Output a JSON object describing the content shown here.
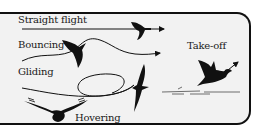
{
  "diagram": {
    "labels": {
      "straight": "Straight flight",
      "bouncing": "Bouncing",
      "gliding": "Gliding",
      "hovering": "Hovering",
      "takeoff": "Take-off"
    },
    "colors": {
      "background": "#f2f2f2",
      "ink": "#111111",
      "frame": "#111111"
    },
    "icons": [
      "straight-flight-bird-icon",
      "bouncing-bird-icon",
      "gliding-bird-icon",
      "hovering-bird-icon",
      "takeoff-bird-icon"
    ]
  }
}
